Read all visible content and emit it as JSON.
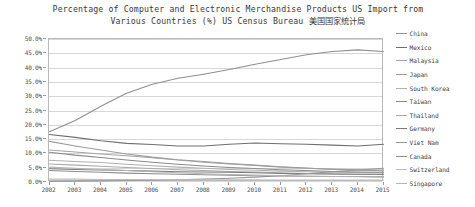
{
  "chart_data": {
    "type": "line",
    "title": "Percentage of Computer and Electronic Merchandise Products US Import from Various Countries (%) US Census Bureau 美国国家统计局",
    "title_lines": [
      "Percentage of Computer and Electronic Merchandise Products US Import from",
      "Various Countries (%) US Census Bureau 美国国家统计局"
    ],
    "xlabel": "",
    "ylabel": "",
    "grid": true,
    "legend_position": "right",
    "ylim": [
      0,
      50
    ],
    "ytick_labels": [
      "50.0%",
      "45.0%",
      "40.0%",
      "35.0%",
      "30.0%",
      "25.0%",
      "20.0%",
      "15.0%",
      "10.0%",
      "5.0%",
      "0.0%"
    ],
    "ytick_values": [
      50,
      45,
      40,
      35,
      30,
      25,
      20,
      15,
      10,
      5,
      0
    ],
    "categories": [
      "2002",
      "2003",
      "2004",
      "2005",
      "2006",
      "2007",
      "2008",
      "2009",
      "2010",
      "2011",
      "2012",
      "2013",
      "2014",
      "2015"
    ],
    "series": [
      {
        "name": "China",
        "color": "#8f8f8f",
        "values": [
          17.6,
          21.5,
          26.5,
          31.0,
          34.2,
          36.3,
          37.7,
          39.3,
          41.2,
          42.8,
          44.5,
          45.6,
          46.2,
          45.6
        ]
      },
      {
        "name": "Mexico",
        "color": "#6e6e6e",
        "values": [
          16.6,
          15.6,
          14.4,
          13.5,
          13.1,
          12.6,
          12.6,
          13.2,
          13.6,
          13.4,
          13.2,
          12.9,
          12.6,
          13.2
        ]
      },
      {
        "name": "Malaysia",
        "color": "#a3a3a3",
        "values": [
          11.2,
          10.5,
          9.8,
          9.2,
          8.5,
          7.7,
          6.9,
          6.3,
          5.8,
          5.2,
          4.8,
          4.5,
          4.3,
          4.2
        ]
      },
      {
        "name": "Japan",
        "color": "#9c9c9c",
        "values": [
          14.2,
          12.6,
          11.2,
          9.8,
          8.7,
          7.8,
          7.2,
          6.5,
          5.9,
          5.3,
          4.9,
          4.4,
          4.1,
          3.9
        ]
      },
      {
        "name": "South Korea",
        "color": "#b0b0b0",
        "values": [
          7.6,
          7.2,
          6.8,
          6.2,
          5.7,
          5.2,
          4.8,
          4.4,
          4.1,
          3.8,
          3.6,
          3.4,
          3.3,
          3.2
        ]
      },
      {
        "name": "Taiwan",
        "color": "#8a8a8a",
        "values": [
          10.4,
          9.4,
          8.6,
          7.7,
          6.9,
          6.2,
          5.6,
          5.1,
          4.7,
          4.3,
          4.0,
          3.7,
          3.5,
          3.4
        ]
      },
      {
        "name": "Thailand",
        "color": "#aaaaaa",
        "values": [
          6.3,
          5.9,
          5.5,
          5.1,
          4.7,
          4.3,
          4.0,
          3.7,
          3.5,
          3.2,
          3.0,
          2.8,
          2.7,
          2.6
        ]
      },
      {
        "name": "Germany",
        "color": "#7a7a7a",
        "values": [
          4.6,
          4.4,
          4.2,
          4.0,
          3.8,
          3.6,
          3.5,
          3.4,
          3.2,
          3.0,
          2.9,
          2.8,
          2.7,
          2.7
        ]
      },
      {
        "name": "Viet Nam",
        "color": "#999999",
        "values": [
          0.2,
          0.3,
          0.4,
          0.5,
          0.6,
          0.8,
          1.0,
          1.3,
          1.7,
          2.2,
          2.9,
          3.6,
          4.2,
          4.8
        ]
      },
      {
        "name": "Canada",
        "color": "#8d8d8d",
        "values": [
          4.0,
          3.7,
          3.4,
          3.1,
          2.9,
          2.7,
          2.5,
          2.4,
          2.2,
          2.1,
          2.0,
          1.9,
          1.9,
          1.8
        ]
      },
      {
        "name": "Switzerland",
        "color": "#bdbdbd",
        "values": [
          1.0,
          1.0,
          0.9,
          0.9,
          0.9,
          0.8,
          0.8,
          0.8,
          0.8,
          0.7,
          0.7,
          0.7,
          0.7,
          0.7
        ]
      },
      {
        "name": "Singapore",
        "color": "#b5b5b5",
        "values": [
          5.2,
          4.8,
          4.4,
          4.0,
          3.6,
          3.2,
          2.9,
          2.6,
          2.4,
          2.2,
          2.0,
          1.9,
          1.8,
          1.7
        ]
      }
    ]
  },
  "legend": {
    "items": [
      {
        "label": "China"
      },
      {
        "label": "Mexico"
      },
      {
        "label": "Malaysia"
      },
      {
        "label": "Japan"
      },
      {
        "label": "South Korea"
      },
      {
        "label": "Taiwan"
      },
      {
        "label": "Thailand"
      },
      {
        "label": "Germany"
      },
      {
        "label": "Viet Nam"
      },
      {
        "label": "Canada"
      },
      {
        "label": "Switzerland"
      },
      {
        "label": "Singapore"
      }
    ]
  }
}
